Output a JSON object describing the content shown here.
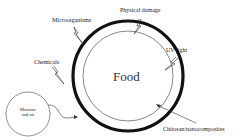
{
  "diagram": {
    "center_label": "Food",
    "coating_label": "Chitosan/nanocomposites",
    "threats": [
      {
        "label": "Microorganisms"
      },
      {
        "label": "Physical damage"
      },
      {
        "label": "UV light"
      },
      {
        "label": "Chemicals"
      }
    ],
    "moisture": {
      "line1": "Moisture",
      "line2": "and air"
    },
    "colors": {
      "stroke": "#111111",
      "text": "#222222",
      "background": "#ffffff"
    }
  }
}
